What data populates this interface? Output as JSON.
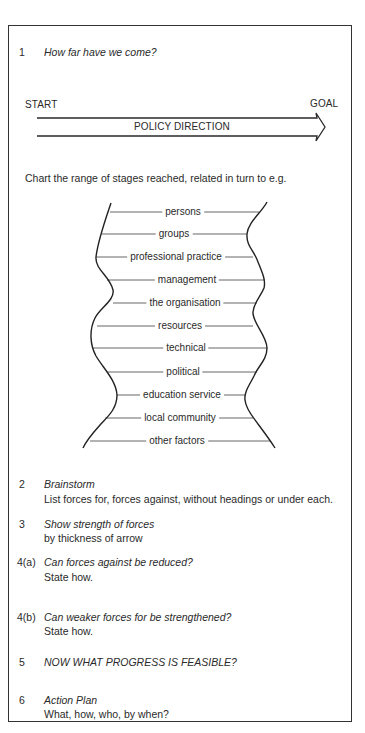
{
  "sections": [
    {
      "number": "1",
      "title": "How far have we come?"
    },
    {
      "number": "2",
      "title": "Brainstorm",
      "body": "List forces for, forces against, without headings or under each."
    },
    {
      "number": "3",
      "title": "Show strength of forces",
      "body": "by thickness of arrow"
    },
    {
      "number": "4(a)",
      "title": "Can forces against be reduced?",
      "body": "State how."
    },
    {
      "number": "4(b)",
      "title": "Can weaker forces for be strengthened?",
      "body": "State how."
    },
    {
      "number": "5",
      "title": "NOW WHAT PROGRESS IS FEASIBLE?"
    },
    {
      "number": "6",
      "title": "Action Plan",
      "body": "What, how, who, by when?"
    }
  ],
  "arrow": {
    "start_label": "START",
    "goal_label": "GOAL",
    "label": "POLICY DIRECTION"
  },
  "chart": {
    "intro": "Chart the range of stages reached, related in turn to e.g.",
    "stages": [
      "persons",
      "groups",
      "professional  practice",
      "management",
      "the  organisation",
      "resources",
      "technical",
      "political",
      "education  service",
      "local  community",
      "other  factors"
    ]
  }
}
